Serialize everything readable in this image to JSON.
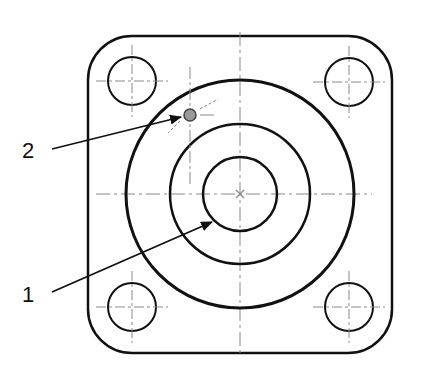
{
  "diagram": {
    "type": "technical-drawing",
    "view": "flange-top-view",
    "colors": {
      "outline": "#111111",
      "centerline": "#8a8a8a",
      "background": "#ffffff",
      "marker_fill": "#9a9a9a"
    },
    "plate": {
      "x": 88,
      "y": 36,
      "width": 304,
      "height": 317,
      "corner_radius": 44
    },
    "center": {
      "x": 240,
      "y": 194
    },
    "circles": [
      {
        "name": "outer-circle",
        "r": 114,
        "stroke": 3
      },
      {
        "name": "middle-circle",
        "r": 70,
        "stroke": 2.5
      },
      {
        "name": "inner-circle",
        "r": 37,
        "stroke": 2.5
      }
    ],
    "bolt_holes": [
      {
        "name": "bolt-hole-top-left",
        "cx": 132,
        "cy": 81,
        "r": 24
      },
      {
        "name": "bolt-hole-top-right",
        "cx": 349,
        "cy": 82,
        "r": 24
      },
      {
        "name": "bolt-hole-bottom-left",
        "cx": 132,
        "cy": 307,
        "r": 24
      },
      {
        "name": "bolt-hole-bottom-right",
        "cx": 349,
        "cy": 307,
        "r": 24
      }
    ],
    "point_marker": {
      "cx": 190,
      "cy": 115,
      "r": 6
    },
    "callouts": [
      {
        "id": "1",
        "label": "1",
        "label_x": 22,
        "label_y": 284,
        "line": {
          "x1": 52,
          "y1": 292,
          "x2": 212,
          "y2": 222
        }
      },
      {
        "id": "2",
        "label": "2",
        "label_x": 22,
        "label_y": 140,
        "line": {
          "x1": 52,
          "y1": 149,
          "x2": 181,
          "y2": 117
        }
      }
    ]
  }
}
